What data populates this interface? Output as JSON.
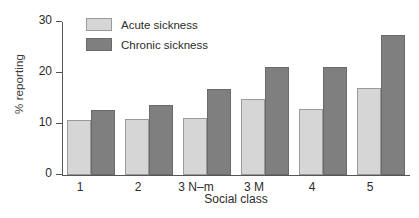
{
  "chart_data": {
    "type": "bar",
    "title": "",
    "xlabel": "Social class",
    "ylabel": "% reporting",
    "categories": [
      "1",
      "2",
      "3 N–m",
      "3 M",
      "4",
      "5"
    ],
    "series": [
      {
        "name": "Acute sickness",
        "color": "#d6d6d6",
        "values": [
          10.8,
          11.0,
          11.2,
          15.0,
          13.0,
          17.0
        ]
      },
      {
        "name": "Chronic sickness",
        "color": "#7f7f7f",
        "values": [
          12.7,
          13.8,
          16.8,
          21.2,
          21.2,
          27.5
        ]
      }
    ],
    "ylim": [
      0,
      30
    ],
    "yticks": [
      0,
      10,
      20,
      30
    ],
    "ytick_labels": [
      "0",
      "10",
      "20",
      "30"
    ],
    "grid": false,
    "legend_position": "top-left-inside"
  }
}
